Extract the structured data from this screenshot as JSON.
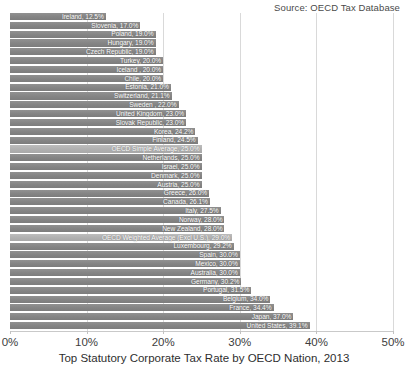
{
  "source_note": "Source: OECD Tax Database",
  "chart_data": {
    "type": "bar",
    "orientation": "horizontal",
    "title": "Top Statutory Corporate Tax Rate by OECD Nation, 2013",
    "xlabel": "Top Statutory Corporate Tax Rate by OECD Nation, 2013",
    "ylabel": "",
    "xlim": [
      0,
      50
    ],
    "grid": true,
    "legend": "none",
    "xtick_labels": [
      "0%",
      "10%",
      "20%",
      "30%",
      "40%",
      "50%"
    ],
    "xticks": [
      0,
      10,
      20,
      30,
      40,
      50
    ],
    "bar_color": "#8a8a8a",
    "highlight_color": "#b4b4b4",
    "categories": [
      "Ireland",
      "Slovenia",
      "Poland",
      "Hungary",
      "Czech Republic",
      "Turkey",
      "Iceland",
      "Chile",
      "Estonia",
      "Switzerland",
      "Sweden",
      "United Kingdom",
      "Slovak Republic",
      "Korea",
      "Finland",
      "OECD Simple Average",
      "Netherlands",
      "Israel",
      "Denmark",
      "Austria",
      "Greece",
      "Canada",
      "Italy",
      "Norway",
      "New Zealand",
      "OECD Weighted Average (Excl U.S.)",
      "Luxembourg",
      "Spain",
      "Mexico",
      "Australia",
      "Germany",
      "Portugal",
      "Belgium",
      "France",
      "Japan",
      "United States"
    ],
    "values": [
      12.5,
      17.0,
      19.0,
      19.0,
      19.0,
      20.0,
      20.0,
      20.0,
      21.0,
      21.1,
      22.0,
      23.0,
      23.0,
      24.2,
      24.5,
      25.0,
      25.0,
      25.0,
      25.0,
      25.0,
      26.0,
      26.1,
      27.5,
      28.0,
      28.0,
      29.0,
      29.2,
      30.0,
      30.0,
      30.0,
      30.2,
      31.5,
      34.0,
      34.4,
      37.0,
      39.1
    ],
    "bars": [
      {
        "label": "Ireland, 12.5%",
        "value": 12.5,
        "highlight": false
      },
      {
        "label": "Slovenia, 17.0%",
        "value": 17.0,
        "highlight": false
      },
      {
        "label": "Poland, 19.0%",
        "value": 19.0,
        "highlight": false
      },
      {
        "label": "Hungary, 19.0%",
        "value": 19.0,
        "highlight": false
      },
      {
        "label": "Czech Republic, 19.0%",
        "value": 19.0,
        "highlight": false
      },
      {
        "label": "Turkey, 20.0%",
        "value": 20.0,
        "highlight": false
      },
      {
        "label": "Iceland , 20.0%",
        "value": 20.0,
        "highlight": false
      },
      {
        "label": "Chile, 20.0%",
        "value": 20.0,
        "highlight": false
      },
      {
        "label": "Estonia, 21.0%",
        "value": 21.0,
        "highlight": false
      },
      {
        "label": "Switzerland, 21.1%",
        "value": 21.1,
        "highlight": false
      },
      {
        "label": "Sweden , 22.0%",
        "value": 22.0,
        "highlight": false
      },
      {
        "label": "United Kingdom, 23.0%",
        "value": 23.0,
        "highlight": false
      },
      {
        "label": "Slovak Republic, 23.0%",
        "value": 23.0,
        "highlight": false
      },
      {
        "label": "Korea, 24.2%",
        "value": 24.2,
        "highlight": false
      },
      {
        "label": "Finland, 24.5%",
        "value": 24.5,
        "highlight": false
      },
      {
        "label": "OECD Simple Average, 25.0%",
        "value": 25.0,
        "highlight": true
      },
      {
        "label": "Netherlands, 25.0%",
        "value": 25.0,
        "highlight": false
      },
      {
        "label": "Israel, 25.0%",
        "value": 25.0,
        "highlight": false
      },
      {
        "label": "Denmark, 25.0%",
        "value": 25.0,
        "highlight": false
      },
      {
        "label": "Austria, 25.0%",
        "value": 25.0,
        "highlight": false
      },
      {
        "label": "Greece, 26.0%",
        "value": 26.0,
        "highlight": false
      },
      {
        "label": "Canada, 26.1%",
        "value": 26.1,
        "highlight": false
      },
      {
        "label": "Italy, 27.5%",
        "value": 27.5,
        "highlight": false
      },
      {
        "label": "Norway, 28.0%",
        "value": 28.0,
        "highlight": false
      },
      {
        "label": "New Zealand, 28.0%",
        "value": 28.0,
        "highlight": false
      },
      {
        "label": "OECD Weighted Average (Excl U.S.), 29.0%",
        "value": 29.0,
        "highlight": true
      },
      {
        "label": "Luxembourg, 29.2%",
        "value": 29.2,
        "highlight": false
      },
      {
        "label": "Spain, 30.0%",
        "value": 30.0,
        "highlight": false
      },
      {
        "label": "Mexico, 30.0%",
        "value": 30.0,
        "highlight": false
      },
      {
        "label": "Australia, 30.0%",
        "value": 30.0,
        "highlight": false
      },
      {
        "label": "Germany, 30.2%",
        "value": 30.2,
        "highlight": false
      },
      {
        "label": "Portugal, 31.5%",
        "value": 31.5,
        "highlight": false
      },
      {
        "label": "Belgium, 34.0%",
        "value": 34.0,
        "highlight": false
      },
      {
        "label": "France, 34.4%",
        "value": 34.4,
        "highlight": false
      },
      {
        "label": "Japan, 37.0%",
        "value": 37.0,
        "highlight": false
      },
      {
        "label": "United States, 39.1%",
        "value": 39.1,
        "highlight": false
      }
    ]
  }
}
